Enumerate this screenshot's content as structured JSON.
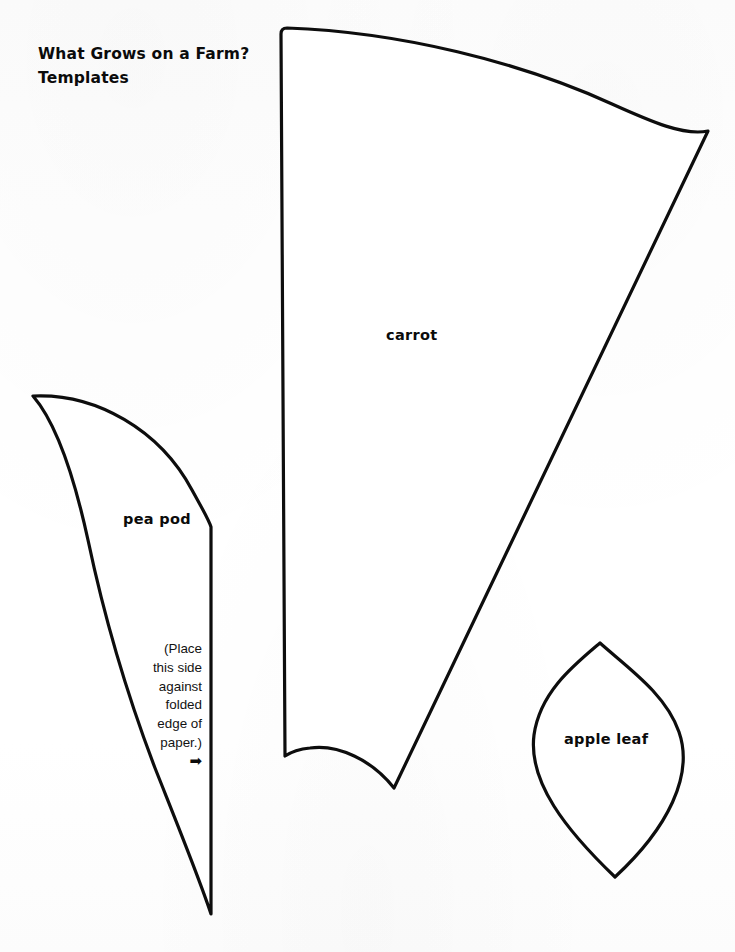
{
  "page": {
    "title_lines": [
      "What Grows on a Farm?",
      "Templates"
    ],
    "background_color": "#fefefe",
    "ink_color": "#0d0d0d",
    "width": 735,
    "height": 952
  },
  "templates": [
    {
      "id": "pea-pod",
      "label": "pea pod",
      "note_lines": [
        "(Place",
        "this side",
        "against",
        "folded",
        "edge of",
        "paper.)"
      ],
      "arrow_glyph": "➡"
    },
    {
      "id": "carrot",
      "label": "carrot"
    },
    {
      "id": "apple-leaf",
      "label": "apple leaf"
    }
  ],
  "labels": {
    "pea_pod": "pea pod",
    "carrot": "carrot",
    "apple_leaf": "apple leaf"
  },
  "fold_note": {
    "line1": "(Place",
    "line2": "this side",
    "line3": "against",
    "line4": "folded",
    "line5": "edge of",
    "line6": "paper.)",
    "arrow": "➡"
  },
  "title": {
    "line1": "What Grows on a Farm?",
    "line2": "Templates"
  }
}
